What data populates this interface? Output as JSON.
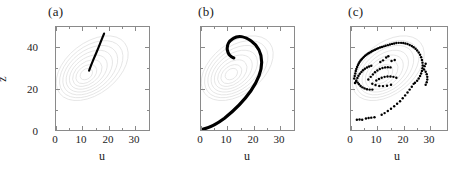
{
  "figure": {
    "panels": [
      {
        "tag": "(a)",
        "name": "panel-a"
      },
      {
        "tag": "(b)",
        "name": "panel-b"
      },
      {
        "tag": "(c)",
        "name": "panel-c"
      }
    ],
    "axis_title_x": "u",
    "axis_title_y": "z",
    "xticklabels": [
      "0",
      "10",
      "20",
      "30"
    ],
    "yticklabels": [
      "0",
      "20",
      "40"
    ],
    "colors": {
      "frame": "#8a8a8a",
      "data": "#000000",
      "background_contour": "#d8d8d8",
      "text": "#1a1a1a"
    }
  },
  "chart_data": [
    {
      "type": "line",
      "title": "(a)",
      "xlabel": "u",
      "ylabel": "z",
      "xlim": [
        0,
        36
      ],
      "ylim": [
        0,
        50
      ],
      "xticks": [
        0,
        10,
        20,
        30
      ],
      "yticks": [
        0,
        20,
        40
      ],
      "xminorticks": [
        5,
        15,
        25,
        35
      ],
      "yminorticks": [
        10,
        30,
        50
      ],
      "grid": false,
      "legend": "none",
      "series": [
        {
          "name": "trajectory-segment",
          "style": "thick-line",
          "points": [
            [
              12.8,
              28.8
            ],
            [
              13.6,
              31.5
            ],
            [
              14.6,
              34.5
            ],
            [
              15.6,
              37.5
            ],
            [
              16.6,
              40.5
            ],
            [
              17.6,
              43.6
            ],
            [
              18.6,
              46.8
            ]
          ]
        },
        {
          "name": "attractor-background",
          "style": "faint-spiral-contours",
          "center": [
            11.5,
            27.0
          ]
        }
      ]
    },
    {
      "type": "line",
      "title": "(b)",
      "xlabel": "u",
      "ylabel": "z",
      "xlim": [
        0,
        36
      ],
      "ylim": [
        0,
        50
      ],
      "xticks": [
        0,
        10,
        20,
        30
      ],
      "yticks": [
        0,
        20,
        40
      ],
      "xminorticks": [
        5,
        15,
        25,
        35
      ],
      "yminorticks": [
        10,
        30,
        50
      ],
      "grid": false,
      "legend": "none",
      "series": [
        {
          "name": "trajectory-spiral",
          "style": "thick-line",
          "points": [
            [
              0.6,
              0.4
            ],
            [
              2.5,
              0.8
            ],
            [
              5.0,
              2.0
            ],
            [
              8.0,
              4.0
            ],
            [
              11.5,
              6.6
            ],
            [
              15.0,
              9.5
            ],
            [
              18.5,
              12.8
            ],
            [
              21.5,
              16.2
            ],
            [
              24.0,
              20.0
            ],
            [
              25.8,
              24.0
            ],
            [
              26.6,
              28.2
            ],
            [
              26.4,
              32.2
            ],
            [
              25.2,
              36.0
            ],
            [
              23.2,
              39.2
            ],
            [
              20.6,
              41.4
            ],
            [
              17.8,
              42.3
            ],
            [
              15.4,
              41.8
            ],
            [
              13.6,
              40.2
            ],
            [
              12.6,
              38.0
            ],
            [
              12.4,
              35.8
            ],
            [
              12.9,
              34.0
            ],
            [
              13.6,
              33.1
            ]
          ]
        },
        {
          "name": "attractor-background",
          "style": "faint-spiral-contours",
          "center": [
            11.5,
            27.0
          ]
        }
      ]
    },
    {
      "type": "scatter",
      "title": "(c)",
      "xlabel": "u",
      "ylabel": "z",
      "xlim": [
        0,
        36
      ],
      "ylim": [
        0,
        50
      ],
      "xticks": [
        0,
        10,
        20,
        30
      ],
      "yticks": [
        0,
        20,
        40
      ],
      "xminorticks": [
        5,
        15,
        25,
        35
      ],
      "yminorticks": [
        10,
        30,
        50
      ],
      "grid": false,
      "legend": "none",
      "series": [
        {
          "name": "sampled-points",
          "style": "dots",
          "points": [
            [
              1.2,
              25.0
            ],
            [
              1.4,
              26.2
            ],
            [
              1.6,
              27.4
            ],
            [
              1.8,
              28.6
            ],
            [
              2.0,
              29.6
            ],
            [
              2.3,
              30.6
            ],
            [
              2.6,
              31.5
            ],
            [
              2.9,
              32.3
            ],
            [
              3.2,
              33.0
            ],
            [
              3.6,
              33.7
            ],
            [
              4.0,
              34.3
            ],
            [
              4.4,
              34.9
            ],
            [
              4.8,
              35.4
            ],
            [
              5.3,
              36.0
            ],
            [
              5.8,
              36.5
            ],
            [
              6.3,
              37.0
            ],
            [
              6.8,
              37.4
            ],
            [
              7.3,
              37.8
            ],
            [
              7.8,
              38.2
            ],
            [
              8.4,
              38.6
            ],
            [
              9.0,
              39.0
            ],
            [
              9.6,
              39.3
            ],
            [
              10.2,
              39.7
            ],
            [
              10.9,
              40.0
            ],
            [
              11.6,
              40.3
            ],
            [
              12.3,
              40.6
            ],
            [
              13.0,
              40.9
            ],
            [
              13.8,
              41.2
            ],
            [
              14.6,
              41.5
            ],
            [
              15.4,
              41.8
            ],
            [
              16.2,
              42.0
            ],
            [
              17.0,
              42.2
            ],
            [
              17.9,
              42.3
            ],
            [
              18.8,
              42.3
            ],
            [
              19.6,
              42.2
            ],
            [
              20.4,
              42.0
            ],
            [
              21.2,
              41.7
            ],
            [
              22.0,
              41.3
            ],
            [
              22.8,
              40.8
            ],
            [
              23.5,
              40.2
            ],
            [
              24.2,
              39.4
            ],
            [
              24.8,
              38.6
            ],
            [
              25.4,
              37.6
            ],
            [
              25.9,
              36.5
            ],
            [
              26.3,
              35.3
            ],
            [
              26.6,
              34.0
            ],
            [
              26.8,
              32.7
            ],
            [
              26.9,
              31.3
            ],
            [
              26.8,
              30.0
            ],
            [
              26.6,
              28.7
            ],
            [
              26.3,
              27.4
            ],
            [
              25.9,
              26.2
            ],
            [
              25.4,
              25.0
            ],
            [
              24.8,
              23.9
            ],
            [
              24.0,
              22.9
            ],
            [
              2.0,
              24.0
            ],
            [
              2.4,
              25.2
            ],
            [
              2.8,
              26.3
            ],
            [
              3.3,
              27.3
            ],
            [
              3.9,
              28.2
            ],
            [
              4.5,
              29.0
            ],
            [
              5.2,
              29.7
            ],
            [
              6.0,
              30.3
            ],
            [
              6.8,
              30.8
            ],
            [
              7.6,
              31.2
            ],
            [
              1.5,
              22.8
            ],
            [
              1.9,
              23.6
            ],
            [
              2.5,
              23.0
            ],
            [
              3.0,
              22.2
            ],
            [
              3.6,
              21.4
            ],
            [
              4.3,
              20.7
            ],
            [
              5.1,
              20.2
            ],
            [
              6.0,
              19.8
            ],
            [
              7.0,
              19.6
            ],
            [
              8.0,
              19.6
            ],
            [
              6.5,
              24.5
            ],
            [
              7.4,
              25.8
            ],
            [
              8.2,
              27.0
            ],
            [
              9.0,
              28.0
            ],
            [
              9.9,
              28.9
            ],
            [
              10.8,
              29.6
            ],
            [
              11.8,
              30.1
            ],
            [
              12.8,
              30.4
            ],
            [
              13.8,
              30.5
            ],
            [
              14.8,
              30.4
            ],
            [
              9.5,
              24.0
            ],
            [
              10.5,
              24.8
            ],
            [
              11.5,
              25.4
            ],
            [
              12.6,
              25.8
            ],
            [
              13.7,
              26.0
            ],
            [
              14.8,
              26.0
            ],
            [
              15.9,
              25.8
            ],
            [
              17.0,
              25.4
            ],
            [
              15.2,
              33.5
            ],
            [
              16.4,
              34.0
            ],
            [
              13.2,
              35.2
            ],
            [
              14.0,
              35.8
            ],
            [
              11.0,
              33.0
            ],
            [
              12.0,
              33.8
            ],
            [
              8.0,
              22.5
            ],
            [
              9.2,
              21.8
            ],
            [
              10.6,
              21.4
            ],
            [
              12.0,
              21.3
            ],
            [
              13.5,
              21.5
            ],
            [
              15.0,
              22.0
            ],
            [
              2.2,
              5.0
            ],
            [
              3.2,
              5.1
            ],
            [
              4.2,
              5.0
            ],
            [
              5.6,
              5.6
            ],
            [
              6.6,
              5.8
            ],
            [
              7.6,
              6.0
            ],
            [
              8.8,
              6.2
            ],
            [
              11.5,
              7.4
            ],
            [
              12.6,
              8.2
            ],
            [
              13.8,
              9.2
            ],
            [
              15.0,
              10.3
            ],
            [
              16.2,
              11.5
            ],
            [
              17.3,
              12.7
            ],
            [
              18.4,
              14.0
            ],
            [
              19.4,
              15.4
            ],
            [
              20.3,
              16.8
            ],
            [
              21.2,
              18.2
            ],
            [
              22.0,
              19.6
            ],
            [
              22.8,
              21.0
            ],
            [
              23.5,
              22.4
            ],
            [
              28.0,
              22.0
            ],
            [
              28.4,
              23.2
            ],
            [
              28.6,
              24.5
            ],
            [
              28.6,
              25.8
            ],
            [
              28.4,
              27.1
            ],
            [
              28.0,
              28.3
            ],
            [
              27.4,
              29.4
            ],
            [
              27.6,
              31.0
            ],
            [
              28.0,
              32.2
            ]
          ]
        },
        {
          "name": "attractor-background",
          "style": "faint-spiral-contours",
          "center": [
            11.5,
            27.0
          ]
        }
      ]
    }
  ]
}
